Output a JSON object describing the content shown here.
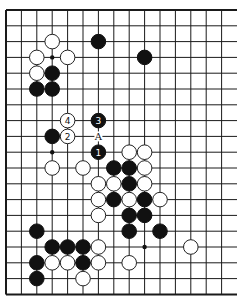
{
  "board": {
    "origin_x": 6,
    "origin_y": 10,
    "col_spacing": 15.4,
    "row_spacing": 15.8,
    "columns": 15,
    "rows": 19,
    "line_right_extent": 237,
    "edges": [
      "left",
      "top",
      "bottom"
    ],
    "colors": {
      "line": "#1a1a1a",
      "black": "#111111",
      "white": "#ffffff",
      "background": "#ffffff"
    },
    "star_points": [
      [
        3,
        3
      ],
      [
        3,
        9
      ],
      [
        9,
        15
      ]
    ],
    "stones": [
      {
        "c": 3,
        "r": 2,
        "color": "white"
      },
      {
        "c": 2,
        "r": 3,
        "color": "white"
      },
      {
        "c": 4,
        "r": 3,
        "color": "white"
      },
      {
        "c": 2,
        "r": 4,
        "color": "white"
      },
      {
        "c": 3,
        "r": 4,
        "color": "black"
      },
      {
        "c": 2,
        "r": 5,
        "color": "black"
      },
      {
        "c": 3,
        "r": 5,
        "color": "black"
      },
      {
        "c": 6,
        "r": 2,
        "color": "black"
      },
      {
        "c": 9,
        "r": 3,
        "color": "black"
      },
      {
        "c": 4,
        "r": 7,
        "color": "white",
        "label": "4"
      },
      {
        "c": 4,
        "r": 8,
        "color": "white",
        "label": "2"
      },
      {
        "c": 6,
        "r": 7,
        "color": "black",
        "label": "3"
      },
      {
        "c": 6,
        "r": 9,
        "color": "black",
        "label": "1"
      },
      {
        "c": 3,
        "r": 8,
        "color": "black"
      },
      {
        "c": 3,
        "r": 10,
        "color": "white"
      },
      {
        "c": 5,
        "r": 10,
        "color": "white"
      },
      {
        "c": 8,
        "r": 9,
        "color": "white"
      },
      {
        "c": 9,
        "r": 9,
        "color": "white"
      },
      {
        "c": 7,
        "r": 10,
        "color": "black"
      },
      {
        "c": 8,
        "r": 10,
        "color": "black"
      },
      {
        "c": 9,
        "r": 10,
        "color": "white"
      },
      {
        "c": 6,
        "r": 11,
        "color": "white"
      },
      {
        "c": 7,
        "r": 11,
        "color": "white"
      },
      {
        "c": 8,
        "r": 11,
        "color": "black"
      },
      {
        "c": 9,
        "r": 11,
        "color": "white"
      },
      {
        "c": 6,
        "r": 12,
        "color": "white"
      },
      {
        "c": 7,
        "r": 12,
        "color": "black"
      },
      {
        "c": 8,
        "r": 12,
        "color": "white"
      },
      {
        "c": 9,
        "r": 12,
        "color": "black"
      },
      {
        "c": 10,
        "r": 12,
        "color": "white"
      },
      {
        "c": 6,
        "r": 13,
        "color": "white"
      },
      {
        "c": 8,
        "r": 13,
        "color": "black"
      },
      {
        "c": 9,
        "r": 13,
        "color": "black"
      },
      {
        "c": 8,
        "r": 14,
        "color": "black"
      },
      {
        "c": 10,
        "r": 14,
        "color": "black"
      },
      {
        "c": 12,
        "r": 15,
        "color": "white"
      },
      {
        "c": 8,
        "r": 16,
        "color": "white"
      },
      {
        "c": 2,
        "r": 14,
        "color": "black"
      },
      {
        "c": 3,
        "r": 15,
        "color": "black"
      },
      {
        "c": 4,
        "r": 15,
        "color": "black"
      },
      {
        "c": 5,
        "r": 15,
        "color": "black"
      },
      {
        "c": 6,
        "r": 15,
        "color": "white"
      },
      {
        "c": 2,
        "r": 16,
        "color": "black"
      },
      {
        "c": 3,
        "r": 16,
        "color": "white"
      },
      {
        "c": 4,
        "r": 16,
        "color": "white"
      },
      {
        "c": 5,
        "r": 16,
        "color": "black"
      },
      {
        "c": 6,
        "r": 16,
        "color": "white"
      },
      {
        "c": 2,
        "r": 17,
        "color": "black"
      },
      {
        "c": 5,
        "r": 17,
        "color": "white"
      }
    ],
    "markers": [
      {
        "c": 6,
        "r": 8,
        "text": "A"
      }
    ]
  }
}
